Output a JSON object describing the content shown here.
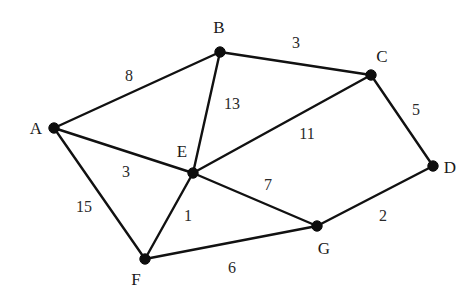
{
  "diagram": {
    "type": "weighted-undirected-graph",
    "background_color": "#ffffff",
    "vertex_color": "#0d0d0d",
    "edge_color": "#111111",
    "label_color": "#1a1a1a",
    "weight_color": "#2a2a2a",
    "vertices": [
      {
        "id": "A",
        "label": "A",
        "x": 54,
        "y": 128,
        "label_x": 36,
        "label_y": 128
      },
      {
        "id": "B",
        "label": "B",
        "x": 220,
        "y": 52,
        "label_x": 219,
        "label_y": 27
      },
      {
        "id": "C",
        "label": "C",
        "x": 371,
        "y": 75,
        "label_x": 382,
        "label_y": 56
      },
      {
        "id": "D",
        "label": "D",
        "x": 433,
        "y": 166,
        "label_x": 450,
        "label_y": 167
      },
      {
        "id": "E",
        "label": "E",
        "x": 193,
        "y": 173,
        "label_x": 182,
        "label_y": 151
      },
      {
        "id": "F",
        "label": "F",
        "x": 145,
        "y": 259,
        "label_x": 136,
        "label_y": 279
      },
      {
        "id": "G",
        "label": "G",
        "x": 317,
        "y": 226,
        "label_x": 324,
        "label_y": 248
      }
    ],
    "edges": [
      {
        "from": "A",
        "to": "B",
        "weight": "8",
        "label_x": 129,
        "label_y": 76
      },
      {
        "from": "B",
        "to": "C",
        "weight": "3",
        "label_x": 296,
        "label_y": 43
      },
      {
        "from": "B",
        "to": "E",
        "weight": "13",
        "label_x": 232,
        "label_y": 104
      },
      {
        "from": "C",
        "to": "D",
        "weight": "5",
        "label_x": 416,
        "label_y": 110
      },
      {
        "from": "C",
        "to": "E",
        "weight": "11",
        "label_x": 307,
        "label_y": 134
      },
      {
        "from": "A",
        "to": "E",
        "weight": "3",
        "label_x": 126,
        "label_y": 172
      },
      {
        "from": "A",
        "to": "F",
        "weight": "15",
        "label_x": 84,
        "label_y": 207
      },
      {
        "from": "E",
        "to": "F",
        "weight": "1",
        "label_x": 188,
        "label_y": 216
      },
      {
        "from": "E",
        "to": "G",
        "weight": "7",
        "label_x": 268,
        "label_y": 185
      },
      {
        "from": "F",
        "to": "G",
        "weight": "6",
        "label_x": 232,
        "label_y": 268
      },
      {
        "from": "D",
        "to": "G",
        "weight": "2",
        "label_x": 383,
        "label_y": 216
      }
    ]
  }
}
